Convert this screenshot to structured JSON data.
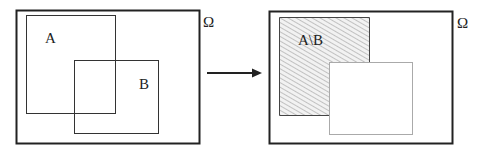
{
  "diagram": {
    "type": "venn-set-difference",
    "left_panel": {
      "universe_label": "Ω",
      "set_a_label": "A",
      "set_b_label": "B"
    },
    "arrow": {
      "direction": "right"
    },
    "right_panel": {
      "universe_label": "Ω",
      "result_label": "A\\B",
      "fill_pattern": "diagonal-hatch"
    },
    "colors": {
      "outline": "#222222",
      "light_outline": "#aaaaaa",
      "hatch": "#bbbbbb",
      "background": "#ffffff"
    }
  }
}
